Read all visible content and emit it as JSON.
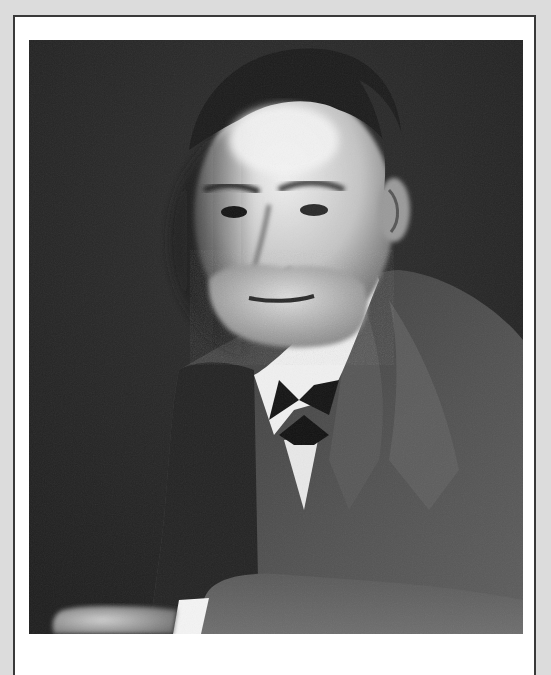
{
  "image": {
    "subject": "Black-and-white studio portrait of an older bearded man in a suit with a bow tie",
    "style": "monochrome photograph",
    "frame": {
      "outer_color": "#dcdcdc",
      "line_color": "#3a3a3a",
      "mat_color": "#ffffff"
    },
    "palette": {
      "background": "#262626",
      "coat": "#4a4a4a",
      "coat_highlight": "#6a6a6a",
      "skin_light": "#e8e8e8",
      "skin_mid": "#a8a8a8",
      "skin_shadow": "#3c3c3c",
      "beard": "#d0d0d0",
      "shirt": "#f2f2f2",
      "bowtie": "#151515",
      "hair": "#1c1c1c"
    },
    "alt_text": "Portrait photograph"
  }
}
